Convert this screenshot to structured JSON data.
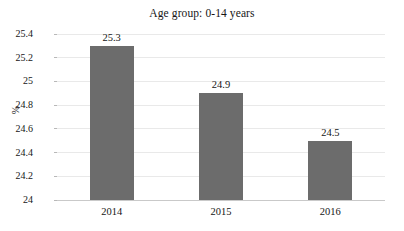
{
  "chart_data": {
    "type": "bar",
    "title": "Age group: 0-14 years",
    "xlabel": "",
    "ylabel": "%",
    "categories": [
      "2014",
      "2015",
      "2016"
    ],
    "values": [
      25.3,
      24.9,
      24.5
    ],
    "data_labels": [
      "25.3",
      "24.9",
      "24.5"
    ],
    "ylim": [
      24,
      25.4
    ],
    "ytick_labels": [
      "25.4",
      "25.2",
      "25",
      "24.8",
      "24.6",
      "24.4",
      "24.2",
      "24"
    ],
    "ytick_values": [
      25.4,
      25.2,
      25,
      24.8,
      24.6,
      24.4,
      24.2,
      24
    ],
    "grid": true,
    "legend": false,
    "legend_position": "none",
    "bar_color": "#6c6c6c",
    "gridline_color": "#e9e9e9",
    "axis_color": "#c9c9c9",
    "background_color": "#ffffff"
  }
}
